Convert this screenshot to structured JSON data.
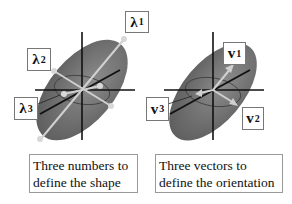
{
  "panels": [
    {
      "name": "shape",
      "labels": [
        {
          "symbol": "λ",
          "subscript": "1"
        },
        {
          "symbol": "λ",
          "subscript": "2"
        },
        {
          "symbol": "λ",
          "subscript": "3"
        }
      ],
      "caption": {
        "line1": "Three numbers to",
        "line2": "define the shape"
      }
    },
    {
      "name": "orientation",
      "labels": [
        {
          "symbol": "v",
          "subscript": "1"
        },
        {
          "symbol": "v",
          "subscript": "2"
        },
        {
          "symbol": "v",
          "subscript": "3"
        }
      ],
      "caption": {
        "line1": "Three vectors to",
        "line2": "define the orientation"
      }
    }
  ],
  "colors": {
    "ellipse_dark": "#6e6e6e",
    "ellipse_light": "#8a8a8a",
    "axis_line": "#111111",
    "eigen_line": "#d0d0d0",
    "box_border": "#777777"
  }
}
